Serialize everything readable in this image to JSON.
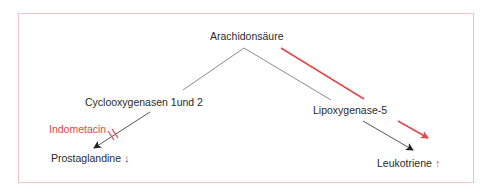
{
  "diagram": {
    "nodes": {
      "root": {
        "label": "Arachidonsäure"
      },
      "cox": {
        "label": "Cyclooxygenasen 1und 2"
      },
      "lox": {
        "label": "Lipoxygenase-5"
      },
      "prostaglandine": {
        "label": "Prostaglandine",
        "indicator": "↓",
        "indicator_meaning": "decrease"
      },
      "leukotriene": {
        "label": "Leukotriene",
        "indicator": "↑",
        "indicator_meaning": "increase"
      }
    },
    "inhibitor": {
      "label": "Indometacin",
      "blocks": "cox-to-prostaglandine"
    },
    "edges": [
      {
        "from": "root",
        "to": "cox",
        "style": "gray-line"
      },
      {
        "from": "root",
        "to": "lox",
        "style": "gray-line"
      },
      {
        "from": "cox",
        "to": "prostaglandine",
        "style": "black-arrow",
        "blocked_by": "Indometacin"
      },
      {
        "from": "lox",
        "to": "leukotriene",
        "style": "black-arrow"
      },
      {
        "from": "root",
        "to": "leukotriene",
        "style": "red-shunt-arrow",
        "meaning": "shunt to lipoxygenase pathway"
      }
    ],
    "colors": {
      "frame": "#f0c4c4",
      "accent_red": "#e0474c",
      "line_gray": "#8a8a8a",
      "arrow_black": "#222222",
      "text": "#2a2a2a"
    }
  }
}
